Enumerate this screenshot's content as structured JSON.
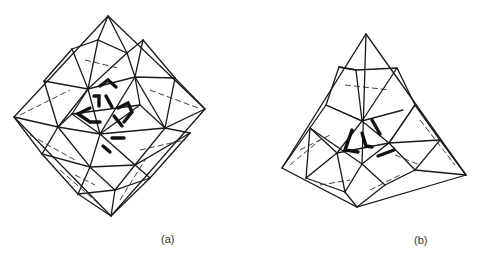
{
  "figure": {
    "panels": [
      {
        "id": "a",
        "label": "(a)",
        "shape": "octahedral space-frame lattice"
      },
      {
        "id": "b",
        "label": "(b)",
        "shape": "tetrahedral space-frame lattice"
      }
    ],
    "colors": {
      "line": "#1a1a1a",
      "background": "#ffffff"
    }
  }
}
